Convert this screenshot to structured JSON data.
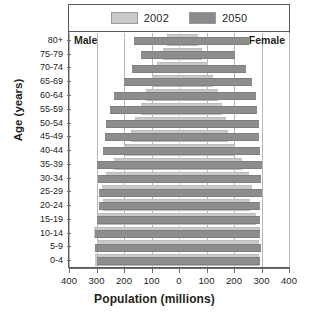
{
  "chart_data": {
    "type": "bar",
    "title": "",
    "subtitle": "",
    "orientation": "population-pyramid",
    "xlabel": "Population (millions)",
    "ylabel": "Age (years)",
    "xlim": [
      -400,
      400
    ],
    "xticks": [
      400,
      300,
      200,
      100,
      0,
      100,
      200,
      300,
      400
    ],
    "xtick_labels": [
      "400",
      "300",
      "200",
      "100",
      "0",
      "100",
      "200",
      "300",
      "400"
    ],
    "grid": true,
    "grid_axis": "x",
    "legend_position": "top",
    "legend": [
      "2002",
      "2050"
    ],
    "side_labels": {
      "left": "Male",
      "right": "Female"
    },
    "categories": [
      "80+",
      "75-79",
      "70-74",
      "65-69",
      "60-64",
      "55-59",
      "50-54",
      "45-49",
      "40-44",
      "35-39",
      "30-34",
      "25-29",
      "20-24",
      "15-19",
      "10-14",
      "5-9",
      "0-4"
    ],
    "series": [
      {
        "name": "2002",
        "color": "#c9c9c9",
        "male": [
          45,
          60,
          80,
          100,
          120,
          140,
          160,
          175,
          200,
          235,
          265,
          280,
          275,
          295,
          310,
          300,
          305
        ],
        "female": [
          70,
          85,
          105,
          125,
          140,
          155,
          170,
          180,
          205,
          230,
          255,
          265,
          260,
          280,
          295,
          290,
          292
        ]
      },
      {
        "name": "2050",
        "color": "#8d8d8d",
        "male": [
          165,
          140,
          170,
          200,
          235,
          250,
          265,
          270,
          275,
          300,
          295,
          290,
          290,
          300,
          305,
          305,
          300
        ],
        "female": [
          255,
          205,
          245,
          265,
          280,
          285,
          290,
          290,
          295,
          300,
          300,
          300,
          295,
          295,
          295,
          300,
          295
        ]
      }
    ]
  }
}
